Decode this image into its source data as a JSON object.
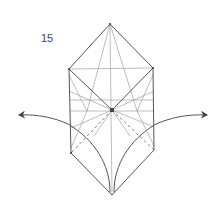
{
  "diagram": {
    "step_number": "15",
    "type": "origami-fold-diagram",
    "colors": {
      "edge": "#555555",
      "crease": "#9a9a9a",
      "arrow": "#555555",
      "background": "#ffffff"
    },
    "vertices": {
      "top": [
        110,
        24
      ],
      "upper_left": [
        69,
        69
      ],
      "upper_right": [
        153,
        68
      ],
      "center": [
        112,
        110
      ],
      "lower_left": [
        71,
        153
      ],
      "lower_right": [
        154,
        150
      ],
      "bottom": [
        112,
        195
      ]
    },
    "arrows": [
      {
        "name": "left-unfold-arrow",
        "direction": "left",
        "head": [
          18,
          115
        ]
      },
      {
        "name": "right-unfold-arrow",
        "direction": "right",
        "head": [
          207,
          115
        ]
      }
    ],
    "line_types": [
      "valley-fold-dashed",
      "crease",
      "edge"
    ]
  }
}
